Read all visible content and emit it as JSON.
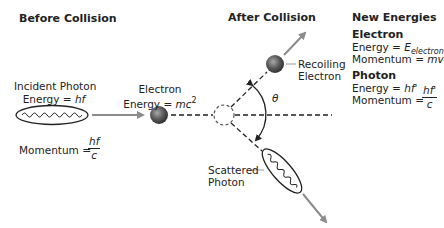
{
  "sections": {
    "before": "Before Collision",
    "after": "After Collision",
    "new_energies": "New Energies"
  },
  "incident_photon": {
    "label": "Incident Photon",
    "energy_prefix": "Energy = ",
    "energy_value": "hf",
    "momentum_prefix": "Momentum = ",
    "momentum_num": "hf",
    "momentum_den": "c"
  },
  "electron_before": {
    "label": "Electron",
    "energy_prefix": "Energy = ",
    "energy_value": "mc",
    "energy_exp": "2"
  },
  "recoiling_electron": {
    "line1": "Recoiling",
    "line2": "Electron"
  },
  "scattered_photon": {
    "line1": "Scattered",
    "line2": "Photon"
  },
  "angle_label": "θ",
  "new_energies": {
    "electron": {
      "title": "Electron",
      "energy_prefix": "Energy = ",
      "energy_symbol": "E",
      "energy_sub": "electron",
      "momentum_prefix": "Momentum = ",
      "momentum_value": "mv"
    },
    "photon": {
      "title": "Photon",
      "energy_prefix": "Energy = ",
      "energy_value": "hf'",
      "momentum_prefix": "Momentum = ",
      "momentum_num": "hf'",
      "momentum_den": "c"
    }
  },
  "colors": {
    "arrow_gray": "#8c8c8c",
    "line": "#222222",
    "sphere_dark": "#3a3a3a",
    "sphere_light": "#9a9a9a"
  }
}
